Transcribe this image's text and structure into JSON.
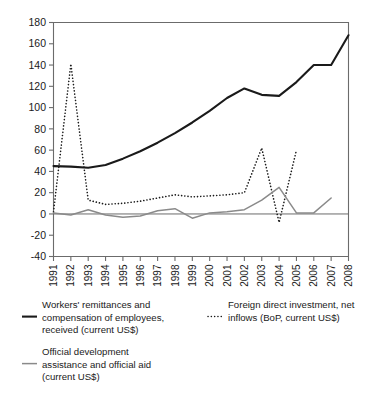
{
  "chart_data": {
    "type": "line",
    "title": "",
    "subtitle": "",
    "xlabel": "",
    "ylabel": "",
    "x": [
      1991,
      1992,
      1993,
      1994,
      1995,
      1996,
      1997,
      1998,
      1999,
      2000,
      2001,
      2002,
      2003,
      2004,
      2005,
      2006,
      2007,
      2008
    ],
    "xtick_labels": [
      "1991",
      "1992",
      "1993",
      "1994",
      "1995",
      "1996",
      "1997",
      "1998",
      "1999",
      "2000",
      "2001",
      "2002",
      "2003",
      "2004",
      "2005",
      "2006",
      "2007",
      "2008"
    ],
    "ylim": [
      -40,
      180
    ],
    "ytick_values": [
      -40,
      -20,
      0,
      20,
      40,
      60,
      80,
      100,
      120,
      140,
      160,
      180
    ],
    "ytick_labels": [
      "-40",
      "-20",
      "0",
      "20",
      "40",
      "60",
      "80",
      "100",
      "120",
      "140",
      "160",
      "180"
    ],
    "grid": false,
    "legend_position": "below",
    "series": [
      {
        "name": "Workers' remittances and compensation of employees, received (current US$)",
        "style": "solid",
        "color": "#1a1a1a",
        "width": 2.1,
        "values": [
          45,
          44.5,
          43.5,
          46,
          52,
          59,
          67,
          76,
          86,
          97,
          109,
          118,
          112,
          111,
          124,
          140,
          140,
          168
        ]
      },
      {
        "name": "Foreign direct investment, net inflows (BoP, current US$)",
        "style": "dotted",
        "color": "#1a1a1a",
        "width": 1.6,
        "values": [
          2,
          141,
          13,
          9,
          10,
          12,
          15,
          18,
          16,
          17,
          18,
          20,
          62,
          -8,
          60,
          null,
          null,
          null
        ]
      },
      {
        "name": "Official development assistance and official aid (current US$)",
        "style": "solid",
        "color": "#8a8a8a",
        "width": 1.5,
        "values": [
          1,
          -1,
          4,
          -1,
          -3,
          -2,
          3,
          5,
          -4,
          1,
          2,
          4,
          13,
          25,
          1,
          1,
          15,
          null
        ]
      }
    ]
  },
  "legend": {
    "entries": [
      {
        "name": "remittances",
        "swatch": "solid-black-line",
        "lines": [
          "Workers' remittances and",
          "compensation of employees,",
          "received (current US$)"
        ]
      },
      {
        "name": "oda",
        "swatch": "solid-gray-line",
        "lines": [
          "Official development",
          "assistance and official aid",
          "(current US$)"
        ]
      },
      {
        "name": "fdi",
        "swatch": "dotted-black-line",
        "lines": [
          "Foreign direct investment, net",
          "inflows (BoP, current US$)"
        ]
      }
    ]
  },
  "colors": {
    "remittances": "#1a1a1a",
    "fdi": "#1a1a1a",
    "oda": "#8a8a8a",
    "axis": "#6b6b6b",
    "background": "#ffffff"
  }
}
